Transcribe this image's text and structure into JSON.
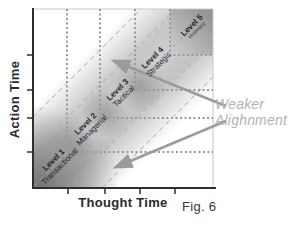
{
  "figure": {
    "caption": "Fig. 6",
    "x_axis_label": "Thought Time",
    "y_axis_label": "Action Time",
    "annotation": {
      "line1": "Weaker",
      "line2": "Alighnment"
    },
    "levels": [
      {
        "name": "Level 1",
        "descriptor": "Transactional"
      },
      {
        "name": "Level 2",
        "descriptor": "Managerial"
      },
      {
        "name": "Level 3",
        "descriptor": "Tactical"
      },
      {
        "name": "Level 4",
        "descriptor": "Strategic"
      },
      {
        "name": "Level 5",
        "descriptor": "Visionary"
      }
    ],
    "colors": {
      "axis": "#2e2e2e",
      "dotted_square": "#999999",
      "dashed_diagonal": "#ababab",
      "diagonal_band": "#c9c9c9",
      "dark_corner": "#6f6f6f",
      "arrow": "#9b9b9b",
      "annotation_text": "#b2b2b2",
      "label_text": "#1f1f1f"
    }
  }
}
